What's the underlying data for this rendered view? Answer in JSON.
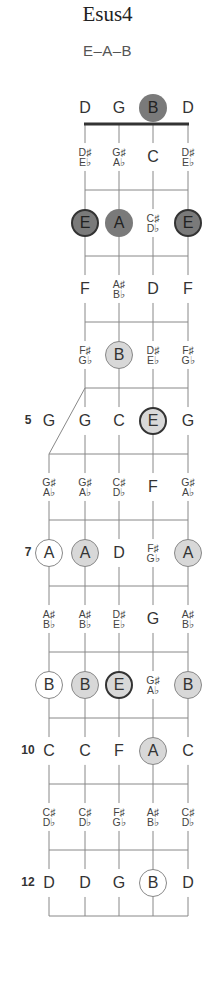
{
  "title": "Esus4",
  "subtitle": "E–A–B",
  "colors": {
    "line": "#888888",
    "nut": "#333333",
    "dark_fill": "#7a7a7a",
    "light_fill": "#d8d8d8",
    "text": "#333333"
  },
  "layout": {
    "strings_x": [
      85,
      119,
      153,
      188
    ],
    "extra_string_x": 49,
    "nut_y": 124,
    "fret_spacing": 66,
    "fret_count": 12
  },
  "open_strings": [
    {
      "note": "D",
      "style": "plain"
    },
    {
      "note": "G",
      "style": "plain"
    },
    {
      "note": "B",
      "style": "dark"
    },
    {
      "note": "D",
      "style": "plain"
    }
  ],
  "fret_numbers": [
    {
      "fret": 5,
      "label": "5"
    },
    {
      "fret": 7,
      "label": "7"
    },
    {
      "fret": 10,
      "label": "10"
    },
    {
      "fret": 12,
      "label": "12"
    }
  ],
  "rows": [
    {
      "fret": 1,
      "extra": null,
      "notes": [
        {
          "sharp": "D♯",
          "flat": "E♭",
          "style": "plain"
        },
        {
          "sharp": "G♯",
          "flat": "A♭",
          "style": "plain"
        },
        {
          "note": "C",
          "style": "plain"
        },
        {
          "sharp": "D♯",
          "flat": "E♭",
          "style": "plain"
        }
      ]
    },
    {
      "fret": 2,
      "extra": null,
      "notes": [
        {
          "note": "E",
          "style": "dark border"
        },
        {
          "note": "A",
          "style": "dark"
        },
        {
          "sharp": "C♯",
          "flat": "D♭",
          "style": "plain"
        },
        {
          "note": "E",
          "style": "dark border"
        }
      ]
    },
    {
      "fret": 3,
      "extra": null,
      "notes": [
        {
          "note": "F",
          "style": "plain"
        },
        {
          "sharp": "A♯",
          "flat": "B♭",
          "style": "plain"
        },
        {
          "note": "D",
          "style": "plain"
        },
        {
          "note": "F",
          "style": "plain"
        }
      ]
    },
    {
      "fret": 4,
      "extra": null,
      "notes": [
        {
          "sharp": "F♯",
          "flat": "G♭",
          "style": "plain"
        },
        {
          "note": "B",
          "style": "light"
        },
        {
          "sharp": "D♯",
          "flat": "E♭",
          "style": "plain"
        },
        {
          "sharp": "F♯",
          "flat": "G♭",
          "style": "plain"
        }
      ]
    },
    {
      "fret": 5,
      "extra": {
        "note": "G",
        "style": "plain"
      },
      "notes": [
        {
          "note": "G",
          "style": "plain"
        },
        {
          "note": "C",
          "style": "plain"
        },
        {
          "note": "E",
          "style": "light border"
        },
        {
          "note": "G",
          "style": "plain"
        }
      ]
    },
    {
      "fret": 6,
      "extra": {
        "sharp": "G♯",
        "flat": "A♭",
        "style": "plain"
      },
      "notes": [
        {
          "sharp": "G♯",
          "flat": "A♭",
          "style": "plain"
        },
        {
          "sharp": "C♯",
          "flat": "D♭",
          "style": "plain"
        },
        {
          "note": "F",
          "style": "plain"
        },
        {
          "sharp": "G♯",
          "flat": "A♭",
          "style": "plain"
        }
      ]
    },
    {
      "fret": 7,
      "extra": {
        "note": "A",
        "style": "outline"
      },
      "notes": [
        {
          "note": "A",
          "style": "light"
        },
        {
          "note": "D",
          "style": "plain"
        },
        {
          "sharp": "F♯",
          "flat": "G♭",
          "style": "plain"
        },
        {
          "note": "A",
          "style": "light"
        }
      ]
    },
    {
      "fret": 8,
      "extra": {
        "sharp": "A♯",
        "flat": "B♭",
        "style": "plain"
      },
      "notes": [
        {
          "sharp": "A♯",
          "flat": "B♭",
          "style": "plain"
        },
        {
          "sharp": "D♯",
          "flat": "E♭",
          "style": "plain"
        },
        {
          "note": "G",
          "style": "plain"
        },
        {
          "sharp": "A♯",
          "flat": "B♭",
          "style": "plain"
        }
      ]
    },
    {
      "fret": 9,
      "extra": {
        "note": "B",
        "style": "outline"
      },
      "notes": [
        {
          "note": "B",
          "style": "light"
        },
        {
          "note": "E",
          "style": "light border"
        },
        {
          "sharp": "G♯",
          "flat": "A♭",
          "style": "plain"
        },
        {
          "note": "B",
          "style": "light"
        }
      ]
    },
    {
      "fret": 10,
      "extra": {
        "note": "C",
        "style": "plain"
      },
      "notes": [
        {
          "note": "C",
          "style": "plain"
        },
        {
          "note": "F",
          "style": "plain"
        },
        {
          "note": "A",
          "style": "light"
        },
        {
          "note": "C",
          "style": "plain"
        }
      ]
    },
    {
      "fret": 11,
      "extra": {
        "sharp": "C♯",
        "flat": "D♭",
        "style": "plain"
      },
      "notes": [
        {
          "sharp": "C♯",
          "flat": "D♭",
          "style": "plain"
        },
        {
          "sharp": "F♯",
          "flat": "G♭",
          "style": "plain"
        },
        {
          "sharp": "A♯",
          "flat": "B♭",
          "style": "plain"
        },
        {
          "sharp": "C♯",
          "flat": "D♭",
          "style": "plain"
        }
      ]
    },
    {
      "fret": 12,
      "extra": {
        "note": "D",
        "style": "plain"
      },
      "notes": [
        {
          "note": "D",
          "style": "plain"
        },
        {
          "note": "G",
          "style": "plain"
        },
        {
          "note": "B",
          "style": "outline"
        },
        {
          "note": "D",
          "style": "plain"
        }
      ]
    }
  ]
}
